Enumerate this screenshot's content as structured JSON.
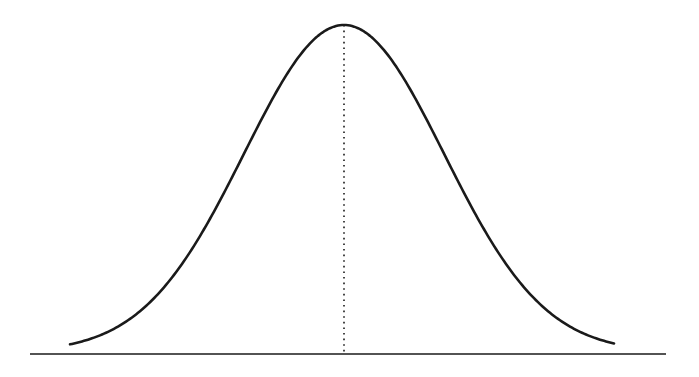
{
  "diagram": {
    "title": "",
    "type": "normal-distribution-bell-curve",
    "colors": {
      "background": "#ffffff",
      "stroke": "#1a1a1a",
      "mean_line": "#1a1a1a"
    },
    "baseline": {
      "x1": 30,
      "x2": 666,
      "y": 354,
      "stroke_width": 1.6
    },
    "curve": {
      "x_start": 70,
      "x_end": 614,
      "mean_x": 344,
      "sigma_px": 100,
      "peak_y": 25,
      "base_y": 352,
      "stroke_width": 2.6
    },
    "mean_line": {
      "style": "dotted",
      "x": 344,
      "y_top": 25,
      "y_bottom": 354,
      "stroke_width": 1.6
    }
  }
}
